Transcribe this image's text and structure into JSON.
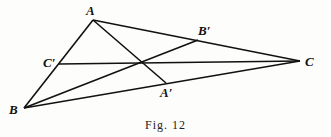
{
  "figure": {
    "caption": "Fig. 12",
    "points": {
      "A": {
        "label": "A",
        "x": 93,
        "y": 20
      },
      "B": {
        "label": "B",
        "x": 24,
        "y": 108
      },
      "C": {
        "label": "C",
        "x": 300,
        "y": 61
      },
      "A_prime": {
        "label": "A′",
        "x": 166,
        "y": 83
      },
      "B_prime": {
        "label": "B′",
        "x": 198,
        "y": 40
      },
      "C_prime": {
        "label": "C′",
        "x": 59,
        "y": 64
      }
    },
    "segments": [
      [
        "A",
        "B"
      ],
      [
        "B",
        "C"
      ],
      [
        "C",
        "A"
      ],
      [
        "A",
        "A_prime"
      ],
      [
        "B",
        "B_prime"
      ],
      [
        "C",
        "C_prime"
      ]
    ],
    "colors": {
      "line": "#111111",
      "background": "#fdfdfb"
    }
  }
}
